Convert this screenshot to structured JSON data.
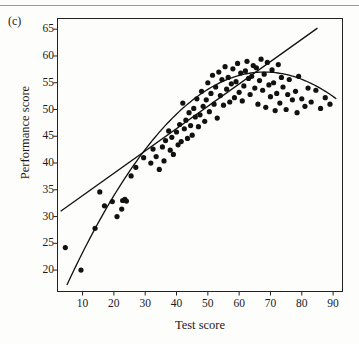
{
  "figure": {
    "panel_label": "(c)",
    "background_color": "#fdfdfc",
    "ink_color": "#111111"
  },
  "chart_data": {
    "type": "scatter",
    "title": "",
    "panel": "(c)",
    "xlabel": "Test score",
    "ylabel": "Performance score",
    "xlim": [
      2,
      93
    ],
    "ylim": [
      16,
      67
    ],
    "xticks": [
      10,
      20,
      30,
      40,
      50,
      60,
      70,
      80,
      90
    ],
    "yticks": [
      20,
      25,
      30,
      35,
      40,
      45,
      50,
      55,
      60,
      65
    ],
    "grid": false,
    "legend": "none",
    "marker": "filled-circle",
    "marker_color": "#111111",
    "points": [
      [
        4.5,
        24.2
      ],
      [
        9.5,
        20.0
      ],
      [
        14.0,
        27.8
      ],
      [
        15.5,
        34.6
      ],
      [
        17.0,
        32.0
      ],
      [
        19.5,
        32.8
      ],
      [
        21.0,
        30.0
      ],
      [
        22.5,
        31.4
      ],
      [
        22.8,
        33.0
      ],
      [
        23.5,
        33.2
      ],
      [
        24.0,
        32.9
      ],
      [
        25.5,
        37.6
      ],
      [
        27.0,
        39.2
      ],
      [
        29.5,
        41.0
      ],
      [
        31.8,
        40.0
      ],
      [
        32.5,
        42.6
      ],
      [
        33.5,
        41.2
      ],
      [
        34.5,
        38.8
      ],
      [
        35.5,
        43.0
      ],
      [
        36.0,
        40.4
      ],
      [
        36.5,
        44.2
      ],
      [
        37.5,
        46.0
      ],
      [
        38.0,
        42.4
      ],
      [
        38.5,
        44.8
      ],
      [
        39.0,
        41.6
      ],
      [
        40.0,
        45.8
      ],
      [
        40.5,
        43.4
      ],
      [
        41.0,
        47.2
      ],
      [
        41.5,
        44.0
      ],
      [
        42.0,
        51.2
      ],
      [
        42.5,
        46.4
      ],
      [
        43.0,
        48.0
      ],
      [
        43.5,
        44.6
      ],
      [
        44.0,
        49.4
      ],
      [
        44.5,
        47.0
      ],
      [
        45.0,
        45.2
      ],
      [
        45.5,
        50.2
      ],
      [
        46.0,
        48.6
      ],
      [
        46.5,
        52.0
      ],
      [
        47.0,
        46.8
      ],
      [
        47.5,
        49.0
      ],
      [
        48.0,
        53.4
      ],
      [
        48.5,
        50.6
      ],
      [
        49.0,
        47.8
      ],
      [
        49.5,
        51.8
      ],
      [
        50.0,
        55.0
      ],
      [
        50.5,
        49.6
      ],
      [
        51.0,
        53.0
      ],
      [
        51.5,
        56.4
      ],
      [
        52.0,
        51.0
      ],
      [
        52.5,
        54.2
      ],
      [
        53.0,
        48.4
      ],
      [
        53.5,
        57.0
      ],
      [
        54.0,
        52.6
      ],
      [
        54.5,
        55.6
      ],
      [
        55.0,
        50.8
      ],
      [
        55.5,
        58.0
      ],
      [
        56.0,
        53.8
      ],
      [
        56.5,
        56.0
      ],
      [
        57.0,
        51.4
      ],
      [
        57.5,
        54.8
      ],
      [
        58.0,
        57.6
      ],
      [
        58.5,
        52.2
      ],
      [
        59.0,
        55.2
      ],
      [
        59.5,
        58.6
      ],
      [
        60.0,
        53.2
      ],
      [
        60.5,
        56.8
      ],
      [
        61.0,
        51.6
      ],
      [
        61.5,
        54.4
      ],
      [
        62.0,
        57.2
      ],
      [
        62.5,
        59.0
      ],
      [
        63.0,
        55.8
      ],
      [
        63.5,
        52.8
      ],
      [
        64.0,
        56.2
      ],
      [
        64.5,
        58.2
      ],
      [
        65.0,
        54.0
      ],
      [
        65.5,
        57.8
      ],
      [
        66.0,
        51.0
      ],
      [
        66.5,
        55.4
      ],
      [
        67.0,
        59.4
      ],
      [
        67.5,
        53.6
      ],
      [
        68.0,
        56.6
      ],
      [
        68.5,
        50.4
      ],
      [
        69.0,
        58.8
      ],
      [
        69.5,
        54.6
      ],
      [
        70.0,
        52.4
      ],
      [
        70.5,
        57.4
      ],
      [
        71.0,
        55.0
      ],
      [
        71.5,
        49.8
      ],
      [
        72.0,
        53.0
      ],
      [
        72.5,
        58.4
      ],
      [
        73.0,
        51.2
      ],
      [
        73.5,
        56.0
      ],
      [
        74.0,
        54.2
      ],
      [
        75.0,
        50.0
      ],
      [
        75.5,
        52.8
      ],
      [
        76.0,
        55.6
      ],
      [
        77.0,
        51.8
      ],
      [
        78.0,
        53.4
      ],
      [
        78.5,
        49.4
      ],
      [
        79.0,
        56.2
      ],
      [
        80.0,
        52.0
      ],
      [
        81.0,
        50.6
      ],
      [
        82.0,
        54.0
      ],
      [
        83.0,
        51.4
      ],
      [
        84.5,
        53.6
      ],
      [
        86.0,
        50.2
      ],
      [
        87.5,
        52.2
      ],
      [
        89.0,
        51.0
      ]
    ],
    "fits": [
      {
        "name": "linear-fit",
        "style": "solid",
        "shape": "straight-line",
        "endpoints": [
          [
            3,
            31.0
          ],
          [
            85,
            65.2
          ]
        ]
      },
      {
        "name": "quadratic-fit",
        "style": "solid",
        "shape": "concave-curve",
        "vertex": [
          68,
          57.0
        ],
        "endpoints": [
          [
            5,
            17.2
          ],
          [
            91,
            52.0
          ]
        ]
      }
    ]
  }
}
